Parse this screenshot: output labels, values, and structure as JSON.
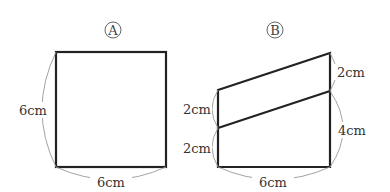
{
  "figures": [
    {
      "id": "A",
      "title": "A",
      "shape": "square",
      "labels": {
        "left": "6cm",
        "bottom": "6cm"
      }
    },
    {
      "id": "B",
      "title": "B",
      "shape": "quadrilateral divided into parallelogram and trapezoid",
      "labels": {
        "right_top": "2cm",
        "right_bottom": "4cm",
        "left_top": "2cm",
        "left_bottom": "2cm",
        "bottom": "6cm"
      }
    }
  ],
  "colors": {
    "line": "#222222",
    "brace": "#999999",
    "text": "#333333"
  }
}
